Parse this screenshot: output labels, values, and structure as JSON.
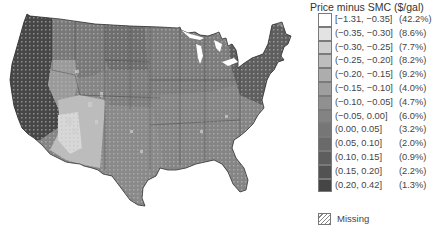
{
  "legend": {
    "title": "Price minus SMC ($/gal)",
    "items": [
      {
        "range": "[−1.31, −0.35]",
        "pct": "(42.2%)",
        "color": "#ffffff"
      },
      {
        "range": "(−0.35, −0.30]",
        "pct": "(8.6%)",
        "color": "#e3e3e3"
      },
      {
        "range": "(−0.30, −0.25]",
        "pct": "(7.7%)",
        "color": "#cfcfcf"
      },
      {
        "range": "(−0.25, −0.20]",
        "pct": "(8.2%)",
        "color": "#bdbdbd"
      },
      {
        "range": "(−0.20, −0.15]",
        "pct": "(9.2%)",
        "color": "#adadad"
      },
      {
        "range": "(−0.15, −0.10]",
        "pct": "(4.0%)",
        "color": "#9e9e9e"
      },
      {
        "range": "(−0.10, −0.05]",
        "pct": "(4.7%)",
        "color": "#909090"
      },
      {
        "range": "(−0.05, 0.00]",
        "pct": "(6.0%)",
        "color": "#838383"
      },
      {
        "range": "(0.00, 0.05]",
        "pct": "(3.2%)",
        "color": "#767676"
      },
      {
        "range": "(0.05, 0.10]",
        "pct": "(2.0%)",
        "color": "#6a6a6a"
      },
      {
        "range": "(0.10, 0.15]",
        "pct": "(0.9%)",
        "color": "#5e5e5e"
      },
      {
        "range": "(0.15, 0.20]",
        "pct": "(2.2%)",
        "color": "#525252"
      },
      {
        "range": "(0.20, 0.42]",
        "pct": "(1.3%)",
        "color": "#454545"
      }
    ],
    "missing_label": "Missing"
  },
  "map": {
    "region": "Contiguous United States, county level",
    "colors": {
      "west_coast": "#4a4a4a",
      "mountain": "#8a8a8a",
      "southwest": "#bdbdbd",
      "plains": "#7a7a7a",
      "midwest": "#808080",
      "south": "#8c8c8c",
      "northeast": "#5c5c5c",
      "border": "#333333"
    }
  }
}
